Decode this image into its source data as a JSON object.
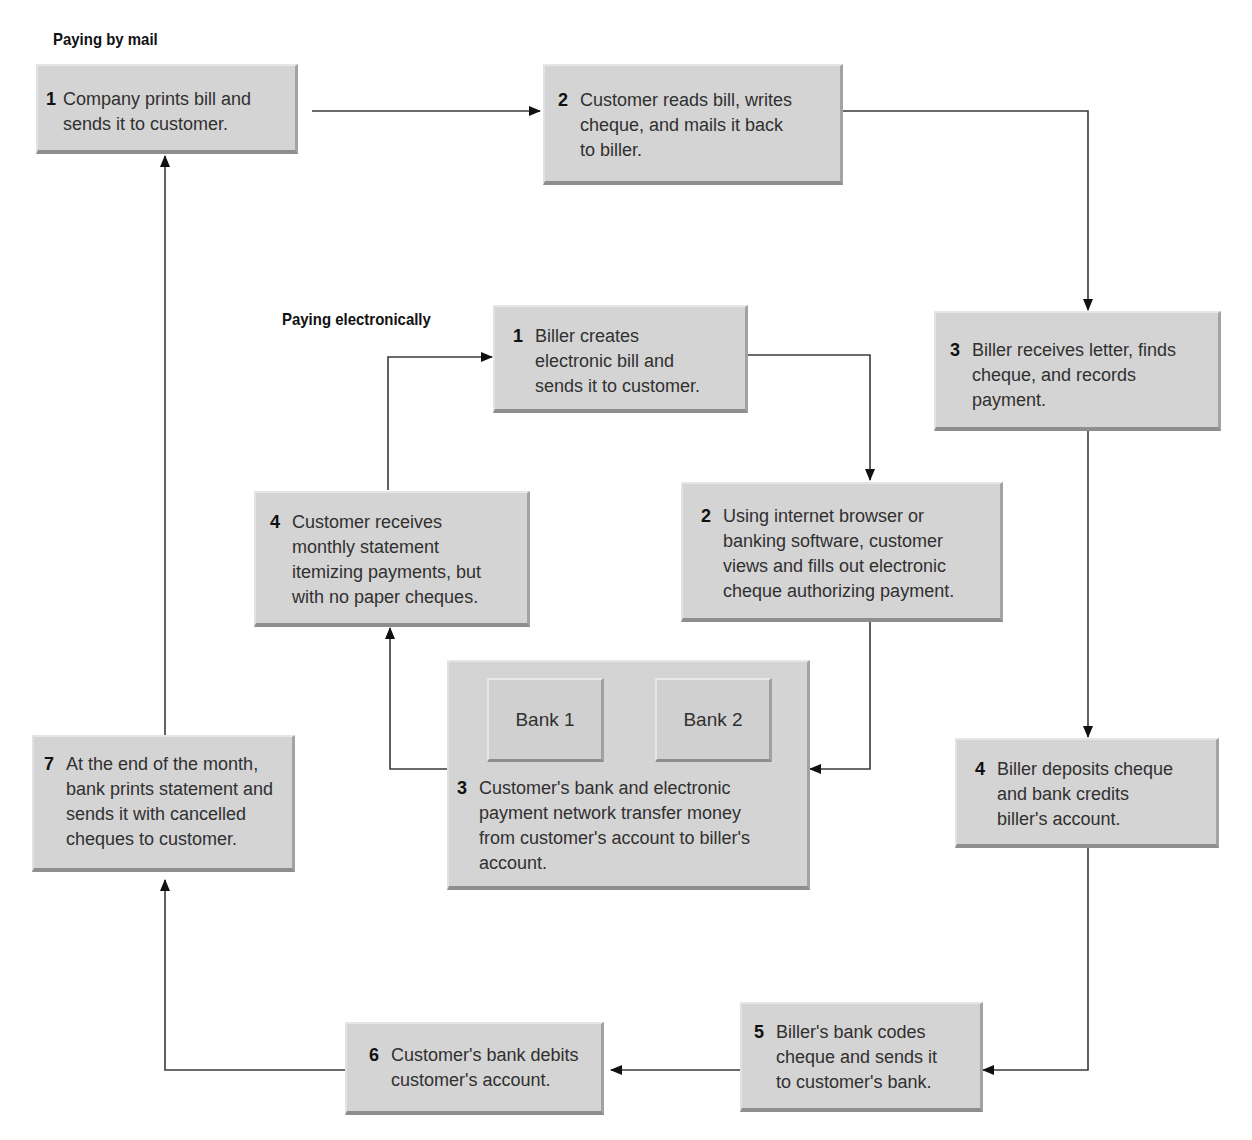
{
  "sections": {
    "mail_title": "Paying by mail",
    "electronic_title": "Paying electronically"
  },
  "mail_steps": [
    {
      "num": "1",
      "text": "Company prints bill and\nsends it to customer."
    },
    {
      "num": "2",
      "text": "Customer reads bill, writes\ncheque, and mails it back\nto biller."
    },
    {
      "num": "3",
      "text": "Biller receives letter, finds\ncheque, and records\npayment."
    },
    {
      "num": "4",
      "text": "Biller deposits cheque\nand bank credits\nbiller's account."
    },
    {
      "num": "5",
      "text": "Biller's bank codes\ncheque and sends it\nto customer's bank."
    },
    {
      "num": "6",
      "text": "Customer's bank debits\ncustomer's account."
    },
    {
      "num": "7",
      "text": "At the end of the month,\nbank prints statement and\nsends it with cancelled\ncheques to customer."
    }
  ],
  "electronic_steps": [
    {
      "num": "1",
      "text": "Biller creates\nelectronic bill and\nsends it to customer."
    },
    {
      "num": "2",
      "text": "Using internet browser or\nbanking software, customer\nviews and fills out electronic\ncheque authorizing payment."
    },
    {
      "num": "3",
      "text": "Customer's bank and electronic\npayment network transfer money\nfrom customer's account to biller's\naccount."
    },
    {
      "num": "4",
      "text": "Customer receives\nmonthly statement\nitemizing payments, but\nwith no paper cheques."
    }
  ],
  "banks": [
    "Bank 1",
    "Bank 2"
  ],
  "colors": {
    "box_fill": "#d4d4d4",
    "line": "#333333",
    "text": "#2a2a2a"
  }
}
